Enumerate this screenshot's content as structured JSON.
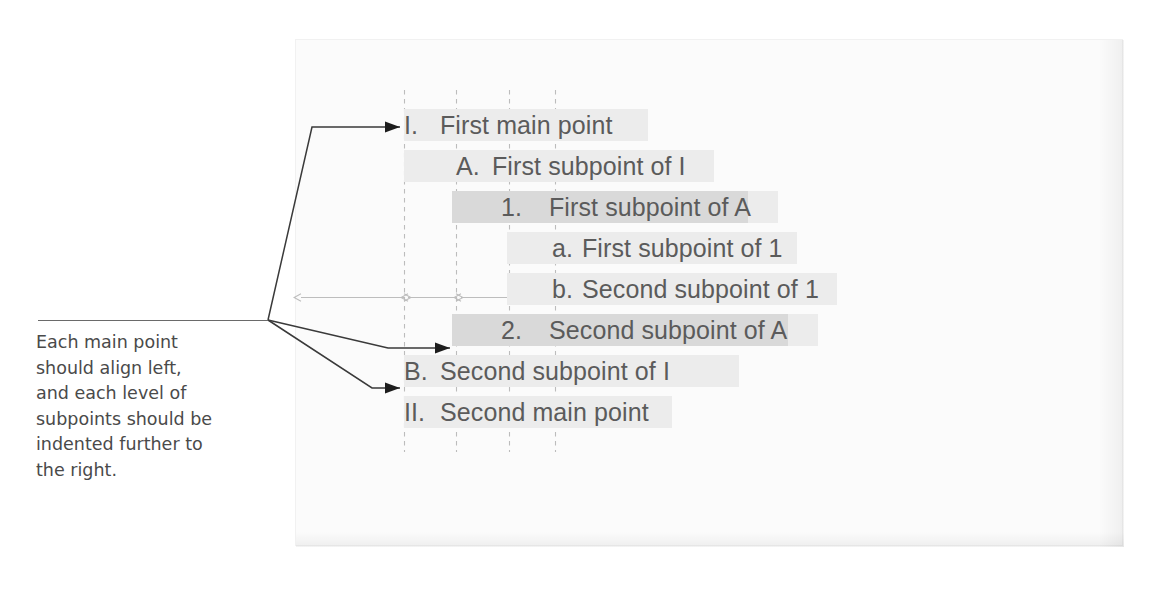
{
  "figure": {
    "card_background": "#fbfbfb",
    "text_color": "#5b5b5b",
    "band_light_color": "#ececec",
    "band_dark_color": "#d9d9d9",
    "guide_color": "#b8b8b8",
    "leader_color": "#3a3a3a"
  },
  "outline": {
    "rows": [
      {
        "marker": "I.",
        "text": "First main point",
        "level": 0
      },
      {
        "marker": "A.",
        "text": "First subpoint of I",
        "level": 1
      },
      {
        "marker": "1.",
        "text": "First subpoint of A",
        "level": 2
      },
      {
        "marker": "a.",
        "text": "First subpoint of 1",
        "level": 3
      },
      {
        "marker": "b.",
        "text": "Second subpoint of 1",
        "level": 3
      },
      {
        "marker": "2.",
        "text": "Second subpoint of A",
        "level": 2
      },
      {
        "marker": "B.",
        "text": "Second subpoint of I",
        "level": 1
      },
      {
        "marker": "II.",
        "text": "Second main point",
        "level": 0
      }
    ]
  },
  "caption": {
    "lines": [
      "Each main point",
      "should align left,",
      "and each level of",
      "subpoints should be",
      "indented further to",
      "the right."
    ]
  },
  "annotations": {
    "leader_arrow_targets": [
      "I.",
      "2.",
      "B."
    ],
    "indent_measure_count": 3,
    "guide_line_count": 4
  }
}
